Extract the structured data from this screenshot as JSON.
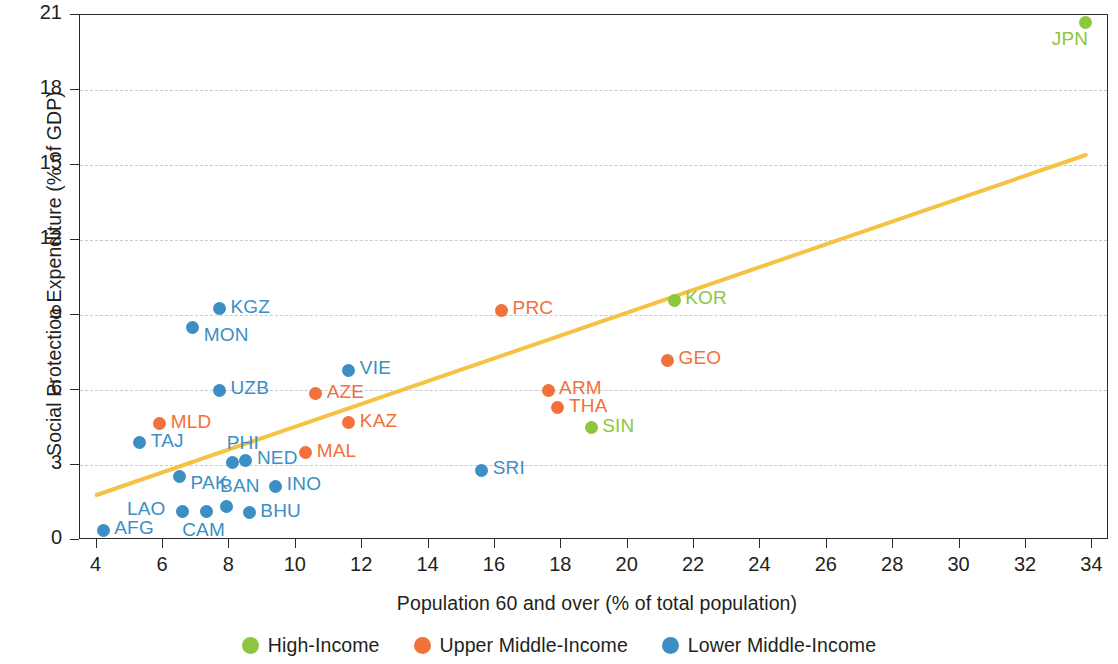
{
  "chart_data": {
    "type": "scatter",
    "title": "",
    "xlabel": "Population 60 and over (% of total population)",
    "ylabel": "Social Protection Expenditure (% of GDP)",
    "xlim": [
      3.5,
      34.5
    ],
    "ylim": [
      0,
      21
    ],
    "xticks": [
      4,
      6,
      8,
      10,
      12,
      14,
      16,
      18,
      20,
      22,
      24,
      26,
      28,
      30,
      32,
      34
    ],
    "yticks": [
      0,
      3,
      6,
      9,
      12,
      15,
      18,
      21
    ],
    "grid": "horizontal-dashed",
    "legend_position": "bottom-center",
    "trendline": {
      "type": "linear",
      "color": "#f6c244",
      "x_start": 4.0,
      "y_start": 1.8,
      "x_end": 33.8,
      "y_end": 15.4
    },
    "series": [
      {
        "name": "High-Income",
        "color": "#8dc63f",
        "points": [
          {
            "label": "JPN",
            "x": 33.8,
            "y": 20.7,
            "label_pos": "below-left"
          },
          {
            "label": "KOR",
            "x": 21.4,
            "y": 9.6,
            "label_pos": "right"
          },
          {
            "label": "SIN",
            "x": 18.9,
            "y": 4.5,
            "label_pos": "right"
          }
        ]
      },
      {
        "name": "Upper Middle-Income",
        "color": "#f2703a",
        "points": [
          {
            "label": "PRC",
            "x": 16.2,
            "y": 9.2,
            "label_pos": "right"
          },
          {
            "label": "GEO",
            "x": 21.2,
            "y": 7.2,
            "label_pos": "right"
          },
          {
            "label": "ARM",
            "x": 17.6,
            "y": 6.0,
            "label_pos": "right"
          },
          {
            "label": "THA",
            "x": 17.9,
            "y": 5.3,
            "label_pos": "right"
          },
          {
            "label": "AZE",
            "x": 10.6,
            "y": 5.85,
            "label_pos": "right"
          },
          {
            "label": "KAZ",
            "x": 11.6,
            "y": 4.7,
            "label_pos": "right"
          },
          {
            "label": "MLD",
            "x": 5.9,
            "y": 4.65,
            "label_pos": "right"
          },
          {
            "label": "MAL",
            "x": 10.3,
            "y": 3.5,
            "label_pos": "right"
          }
        ]
      },
      {
        "name": "Lower Middle-Income",
        "color": "#3b8fc4",
        "points": [
          {
            "label": "KGZ",
            "x": 7.7,
            "y": 9.25,
            "label_pos": "right"
          },
          {
            "label": "MON",
            "x": 6.9,
            "y": 8.5,
            "label_pos": "below-right"
          },
          {
            "label": "VIE",
            "x": 11.6,
            "y": 6.8,
            "label_pos": "right"
          },
          {
            "label": "UZB",
            "x": 7.7,
            "y": 6.0,
            "label_pos": "right"
          },
          {
            "label": "TAJ",
            "x": 5.3,
            "y": 3.9,
            "label_pos": "right"
          },
          {
            "label": "PHI",
            "x": 8.1,
            "y": 3.1,
            "label_pos": "above-right"
          },
          {
            "label": "NED",
            "x": 8.5,
            "y": 3.2,
            "label_pos": "right"
          },
          {
            "label": "PAK",
            "x": 6.5,
            "y": 2.55,
            "label_pos": "below-right"
          },
          {
            "label": "SRI",
            "x": 15.6,
            "y": 2.8,
            "label_pos": "right"
          },
          {
            "label": "INO",
            "x": 9.4,
            "y": 2.15,
            "label_pos": "right"
          },
          {
            "label": "BAN",
            "x": 7.9,
            "y": 1.35,
            "label_pos": "above-right"
          },
          {
            "label": "BHU",
            "x": 8.6,
            "y": 1.1,
            "label_pos": "right"
          },
          {
            "label": "LAO",
            "x": 6.6,
            "y": 1.15,
            "label_pos": "left"
          },
          {
            "label": "CAM",
            "x": 7.3,
            "y": 1.15,
            "label_pos": "below"
          },
          {
            "label": "AFG",
            "x": 4.2,
            "y": 0.4,
            "label_pos": "right"
          }
        ]
      }
    ]
  },
  "legend": {
    "items": [
      {
        "label": "High-Income",
        "color": "#8dc63f"
      },
      {
        "label": "Upper Middle-Income",
        "color": "#f2703a"
      },
      {
        "label": "Lower Middle-Income",
        "color": "#3b8fc4"
      }
    ]
  }
}
